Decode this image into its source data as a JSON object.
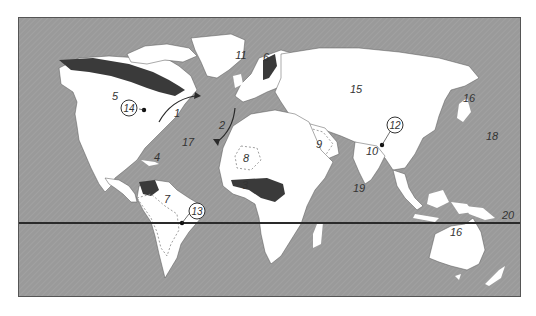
{
  "map": {
    "colors": {
      "ocean": "#9a9a9a",
      "land": "#ffffff",
      "highlight": "#3a3a3a",
      "line": "#2a2a2a"
    },
    "labels": {
      "l1": "1",
      "l2": "2",
      "l3": "3",
      "l4": "4",
      "l5": "5",
      "l6": "6",
      "l7": "7",
      "l8": "8",
      "l9": "9",
      "l10": "10",
      "l11": "11",
      "l12": "12",
      "l13": "13",
      "l14": "14",
      "l15": "15",
      "l16": "16",
      "l17": "17",
      "l18": "18",
      "l19": "19",
      "l20": "20"
    },
    "circled_labels": [
      "12",
      "13",
      "14"
    ],
    "reference_line": "20"
  }
}
